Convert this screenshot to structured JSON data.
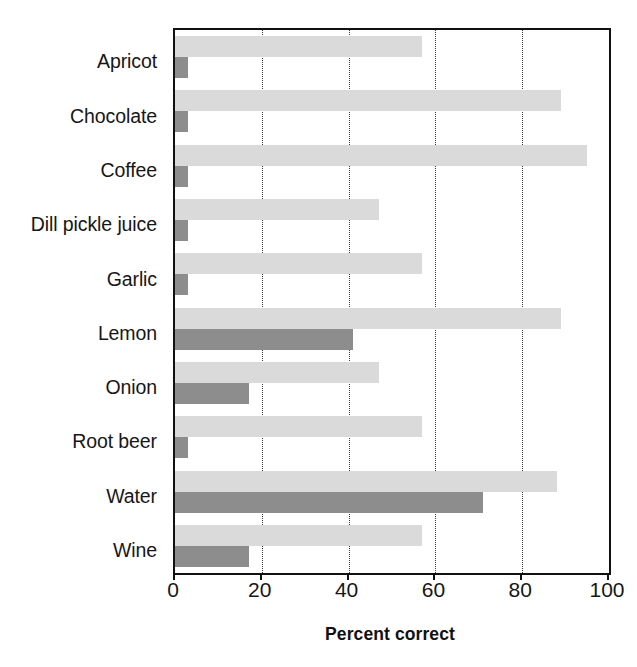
{
  "chart_data": {
    "type": "bar",
    "orientation": "horizontal",
    "title": "",
    "xlabel": "Percent correct",
    "ylabel": "",
    "xlim": [
      0,
      100
    ],
    "ylim": null,
    "grid": true,
    "grid_axis": "x",
    "legend": null,
    "xticks": [
      0,
      20,
      40,
      60,
      80,
      100
    ],
    "xticklabels": [
      "0",
      "20",
      "40",
      "60",
      "80",
      "100"
    ],
    "categories": [
      "Apricot",
      "Chocolate",
      "Coffee",
      "Dill pickle juice",
      "Garlic",
      "Lemon",
      "Onion",
      "Root beer",
      "Water",
      "Wine"
    ],
    "series": [
      {
        "name": "light-bar",
        "color": "#dadada",
        "values": [
          57,
          89,
          95,
          47,
          57,
          89,
          47,
          57,
          88,
          57
        ]
      },
      {
        "name": "dark-bar",
        "color": "#8d8d8d",
        "values": [
          3,
          3,
          3,
          3,
          3,
          41,
          17,
          3,
          71,
          17
        ]
      }
    ]
  },
  "axis": {
    "title": "Percent correct",
    "tick_labels": [
      "0",
      "20",
      "40",
      "60",
      "80",
      "100"
    ],
    "category_labels": [
      "Apricot",
      "Chocolate",
      "Coffee",
      "Dill pickle juice",
      "Garlic",
      "Lemon",
      "Onion",
      "Root beer",
      "Water",
      "Wine"
    ]
  },
  "colors": {
    "light_bar": "#dadada",
    "dark_bar": "#8d8d8d",
    "frame": "#111111",
    "gridline": "#3a3a3a",
    "background": "#ffffff",
    "text": "#161616"
  }
}
